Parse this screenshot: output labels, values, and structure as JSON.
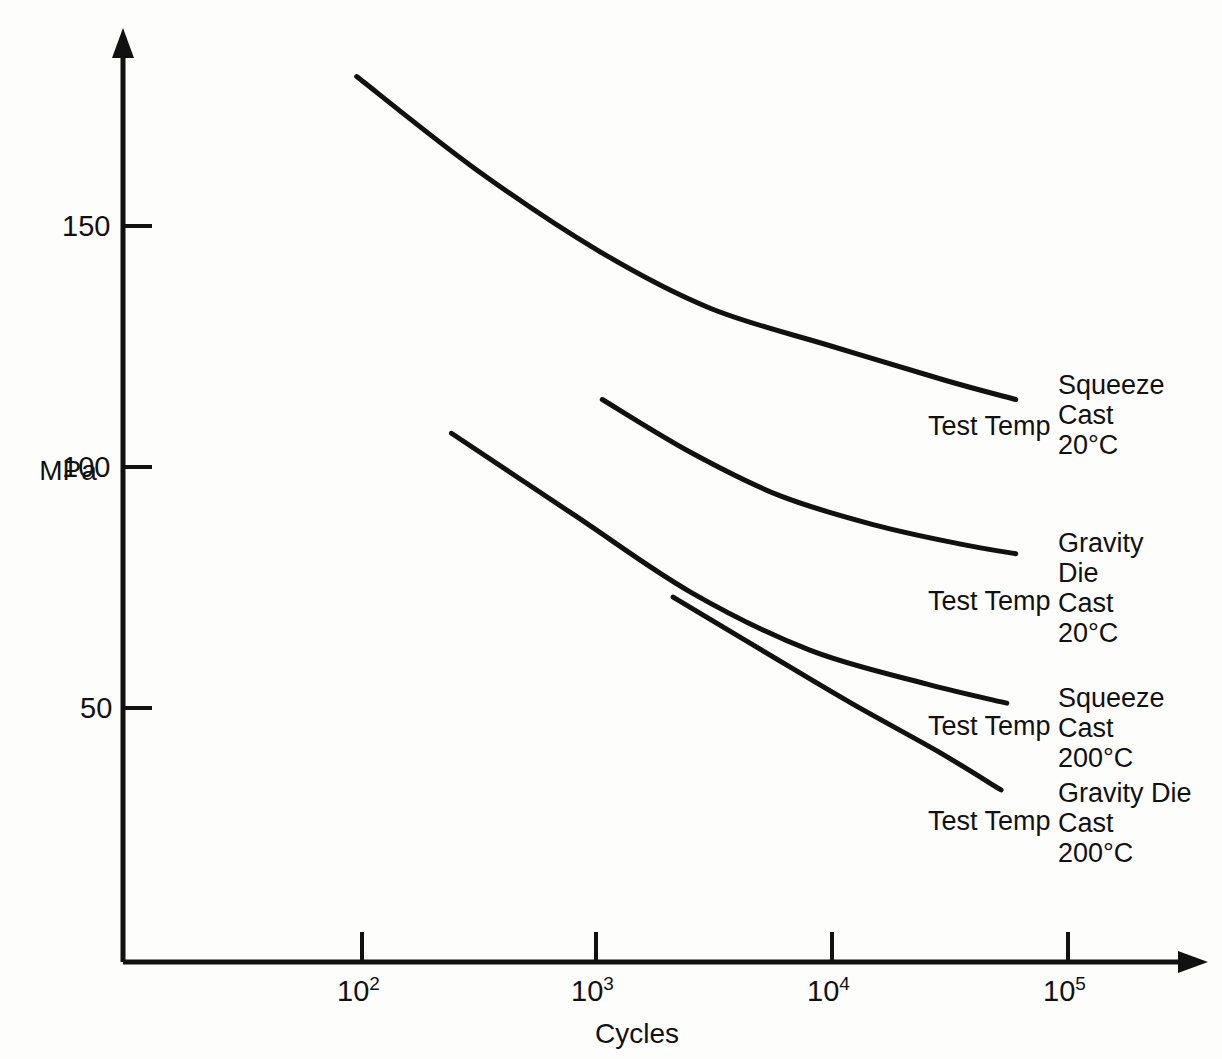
{
  "chart_data": {
    "type": "line",
    "title": "",
    "xlabel": "Cycles",
    "ylabel": "MPa",
    "xscale": "log",
    "xlim": [
      30,
      200000
    ],
    "ylim": [
      0,
      190
    ],
    "grid": false,
    "legend": "inline-right",
    "x_tick_labels": [
      "10",
      "10",
      "10",
      "10"
    ],
    "x_tick_exponents": [
      "2",
      "3",
      "4",
      "5"
    ],
    "x_tick_values": [
      100,
      1000,
      10000,
      100000
    ],
    "y_tick_labels": [
      "150",
      "100",
      "50"
    ],
    "y_tick_values": [
      150,
      100,
      50
    ],
    "series": [
      {
        "name": "Squeeze Cast 20°C",
        "label_lines": [
          "Squeeze",
          "Cast",
          "20°C"
        ],
        "test_temp_label": "Test Temp",
        "points": [
          {
            "x": 95,
            "y": 181
          },
          {
            "x": 300,
            "y": 162
          },
          {
            "x": 1000,
            "y": 145
          },
          {
            "x": 3000,
            "y": 133
          },
          {
            "x": 10000,
            "y": 125
          },
          {
            "x": 30000,
            "y": 118
          },
          {
            "x": 60000,
            "y": 114
          }
        ]
      },
      {
        "name": "Gravity Die Cast 20°C",
        "label_lines": [
          "Gravity",
          "Die",
          "Cast",
          "20°C"
        ],
        "test_temp_label": "Test Temp",
        "points": [
          {
            "x": 1050,
            "y": 114
          },
          {
            "x": 2500,
            "y": 103
          },
          {
            "x": 6000,
            "y": 94
          },
          {
            "x": 15000,
            "y": 88
          },
          {
            "x": 35000,
            "y": 84
          },
          {
            "x": 60000,
            "y": 82
          }
        ]
      },
      {
        "name": "Squeeze Cast 200°C",
        "label_lines": [
          "Squeeze",
          "Cast",
          "200°C"
        ],
        "test_temp_label": "Test Temp",
        "points": [
          {
            "x": 240,
            "y": 107
          },
          {
            "x": 800,
            "y": 90
          },
          {
            "x": 2500,
            "y": 74
          },
          {
            "x": 8000,
            "y": 62
          },
          {
            "x": 25000,
            "y": 55
          },
          {
            "x": 55000,
            "y": 51
          }
        ]
      },
      {
        "name": "Gravity Die Cast 200°C",
        "label_lines": [
          "Gravity Die",
          "Cast",
          "200°C"
        ],
        "test_temp_label": "Test Temp",
        "points": [
          {
            "x": 2100,
            "y": 73
          },
          {
            "x": 5000,
            "y": 62
          },
          {
            "x": 12000,
            "y": 51
          },
          {
            "x": 28000,
            "y": 41
          },
          {
            "x": 52000,
            "y": 33
          }
        ]
      }
    ]
  },
  "axes": {
    "y_label": "MPa",
    "x_label": "Cycles",
    "x_ticks": [
      {
        "base": "10",
        "exp": "2"
      },
      {
        "base": "10",
        "exp": "3"
      },
      {
        "base": "10",
        "exp": "4"
      },
      {
        "base": "10",
        "exp": "5"
      }
    ],
    "y_ticks": [
      "150",
      "100",
      "50"
    ]
  },
  "annotations": {
    "series1": {
      "test_temp": "Test Temp",
      "line1": "Squeeze",
      "line2": "Cast",
      "line3": "20°C"
    },
    "series2": {
      "test_temp": "Test Temp",
      "line1": "Gravity",
      "line2": "Die",
      "line3": "Cast",
      "line4": "20°C"
    },
    "series3": {
      "test_temp": "Test Temp",
      "line1": "Squeeze",
      "line2": "Cast",
      "line3": "200°C"
    },
    "series4": {
      "test_temp": "Test Temp",
      "line1": "Gravity Die",
      "line2": "Cast",
      "line3": "200°C"
    }
  },
  "colors": {
    "ink": "#111111",
    "background": "#fdfdfc"
  }
}
